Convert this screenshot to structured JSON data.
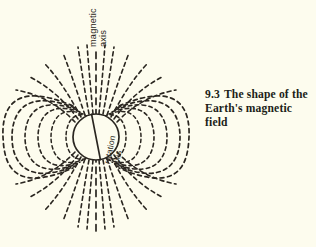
{
  "figure": {
    "caption": {
      "number": "9.3",
      "line1": "The shape of the",
      "line2": "Earth's magnetic field",
      "full_text": "9.3  The shape of the Earth's magnetic field"
    },
    "labels": {
      "magnetic_axis_line1": "magnetic",
      "magnetic_axis_line2": "axis",
      "rotation_axis_line1": "rotation",
      "rotation_axis_line2": "axis"
    },
    "colors": {
      "background": "#fdfcee",
      "ink": "#2a2620",
      "earth_fill": "#fdfcee",
      "caption_text": "#211e18"
    },
    "diagram": {
      "type": "dipole-field-diagram",
      "earth": {
        "center_x": 96,
        "center_y": 137,
        "radius": 23,
        "stroke_style": "solid"
      },
      "magnetic_axis": {
        "tilt_degrees": 0,
        "orientation": "vertical",
        "stroke_style": "dashed"
      },
      "rotation_axis": {
        "tilt_degrees": 11,
        "orientation": "tilted-from-vertical",
        "stroke_style": "solid"
      },
      "field_lines": {
        "style": "dashed",
        "closed_loop_count_per_side": 6,
        "polar_fan_line_count_per_pole": 13,
        "description": "nested closed dipole loops on each flank with radiating open lines at both poles"
      }
    }
  }
}
